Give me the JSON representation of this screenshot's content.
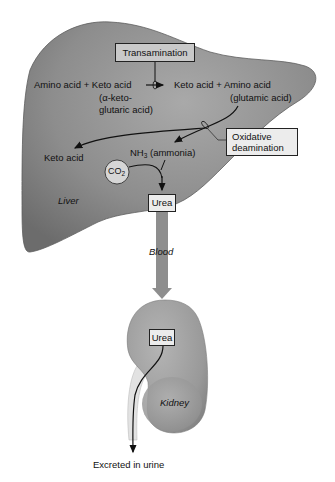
{
  "diagram": {
    "organs": {
      "liver": {
        "label": "Liver",
        "fill": "#8a8a8a"
      },
      "kidney": {
        "label": "Kidney",
        "fill": "#9a9a9a"
      }
    },
    "transamination": {
      "box_label": "Transamination",
      "reactants": "Amino acid + Keto acid",
      "reactant_note_line1": "(α-keto-",
      "reactant_note_line2": "glutaric acid)",
      "products": "Keto acid + Amino acid",
      "product_note": "(glutamic acid)"
    },
    "oxidative_deamination": {
      "box_label_line1": "Oxidative",
      "box_label_line2": "deamination",
      "product_keto": "Keto acid",
      "product_nh3_main": "NH",
      "product_nh3_sub": "3",
      "product_nh3_note": " (ammonia)"
    },
    "co2": {
      "main": "CO",
      "sub": "2"
    },
    "urea_liver": "Urea",
    "blood_label": "Blood",
    "urea_kidney": "Urea",
    "excretion_label": "Excreted in urine",
    "colors": {
      "liver_dark": "#6f6f6f",
      "liver_light": "#a8a8a8",
      "kidney": "#9c9c9c",
      "blood_vessel": "#8e8e8e",
      "box_gray": "#c9c9c9",
      "box_light": "#ececec",
      "ink": "#111111"
    }
  }
}
